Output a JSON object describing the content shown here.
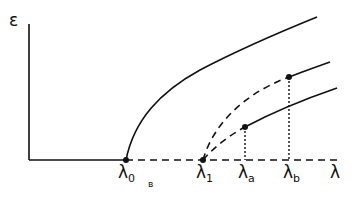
{
  "figure": {
    "type": "bifurcation-diagram",
    "y_axis_label": "ε",
    "x_axis_label": "λ",
    "panel_label": "в",
    "ticks": [
      {
        "symbol": "λ",
        "sub": "0"
      },
      {
        "symbol": "λ",
        "sub": "1"
      },
      {
        "symbol": "λ",
        "sub": "a"
      },
      {
        "symbol": "λ",
        "sub": "b"
      }
    ],
    "curves": [
      {
        "name": "main-branch",
        "style": "solid",
        "from": "λ0"
      },
      {
        "name": "upper-secondary-branch",
        "style": "dashed-then-solid",
        "from": "λ1",
        "switch_at": "λb"
      },
      {
        "name": "lower-secondary-branch",
        "style": "dashed-then-solid",
        "from": "λ1",
        "switch_at": "λa"
      }
    ],
    "baseline": {
      "solid_until": "λ0",
      "dashed_after": "λ0"
    },
    "colors": {
      "ink": "#111111",
      "background": "#ffffff"
    }
  }
}
